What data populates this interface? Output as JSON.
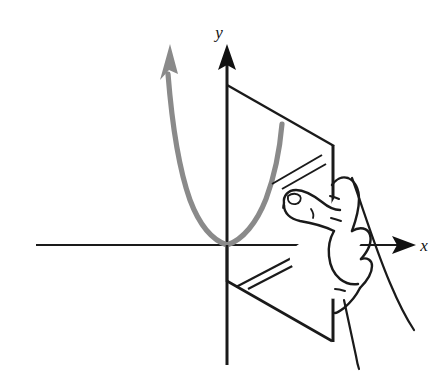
{
  "figure": {
    "background_color": "#ffffff",
    "axes": {
      "x_label": "x",
      "y_label": "y",
      "axis_color": "#1a1a1a",
      "origin": {
        "x": 227,
        "y": 245
      },
      "x_axis": {
        "start_x": 36,
        "end_x": 408,
        "y": 245,
        "arrow": "right"
      },
      "y_axis": {
        "x": 227,
        "start_y": 365,
        "end_y": 48,
        "arrow": "up"
      }
    },
    "curve": {
      "name": "parabola",
      "color": "#8a8a8a",
      "stroke_width": 5,
      "vertex": {
        "x": 227,
        "y": 245
      },
      "left_arrow_tip": {
        "x": 166,
        "y": 42
      },
      "right_end": {
        "x": 282,
        "y": 122
      },
      "points_left": "227,245 213,238 201,225 191,205 182,178 174,145 168,108 165,72",
      "points_right": "227,245 241,239 254,224 264,203 272,176 278,148 282,126"
    },
    "plane": {
      "name": "vertical-plane",
      "edge_color": "#1a1a1a",
      "fill": "#ffffff",
      "upper_quad": "227,85 333,145 333,245 227,245",
      "lower_quad": "227,245 333,245 333,341 227,281",
      "glints_upper": [
        {
          "x1": 272,
          "y1": 183,
          "x2": 322,
          "y2": 155
        },
        {
          "x1": 281,
          "y1": 188,
          "x2": 325,
          "y2": 163
        }
      ],
      "glints_lower": [
        {
          "x1": 236,
          "y1": 286,
          "x2": 302,
          "y2": 252
        },
        {
          "x1": 247,
          "y1": 288,
          "x2": 303,
          "y2": 259
        }
      ]
    },
    "hand": {
      "name": "hand-gripping-plane",
      "outline_color": "#1a1a1a",
      "fill": "#ffffff",
      "description": "Right hand holding the vertical plane, index finger pointing left across the plane, remaining fingers wrapped behind the right edge"
    }
  }
}
